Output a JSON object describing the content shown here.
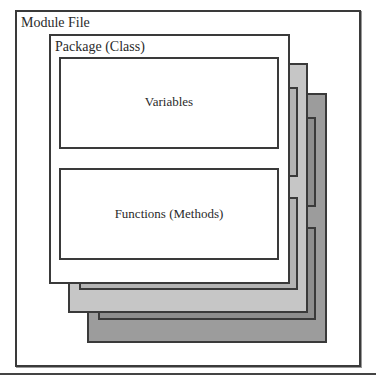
{
  "diagram": {
    "module": {
      "label": "Module File"
    },
    "package": {
      "label": "Package (Class)"
    },
    "variables": {
      "label": "Variables"
    },
    "functions": {
      "label": "Functions (Methods)"
    },
    "stack_layers": [
      {
        "name": "layer-2",
        "fill": "#c6c6c6",
        "inner_fill": "#b4b4b4"
      },
      {
        "name": "layer-3",
        "fill": "#9c9c9c",
        "inner_fill": "#8e8e8e"
      }
    ],
    "colors": {
      "border": "#3a3a3a",
      "background": "#ffffff",
      "text": "#2a2a2a"
    }
  }
}
